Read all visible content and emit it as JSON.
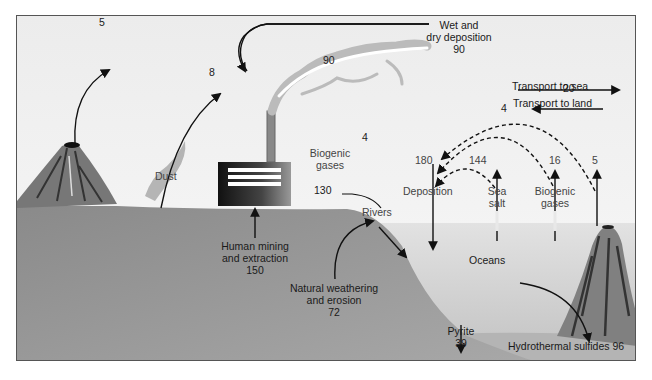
{
  "diagram": {
    "colors": {
      "sky": "#ececec",
      "land": "#8c8c8c",
      "ocean": "#c8c8c8",
      "arrow": "#111111",
      "frame": "#555555"
    },
    "atmosphere": {
      "volcanic_emission": "5",
      "dust": {
        "label": "Dust",
        "value": "8"
      },
      "industrial_cloud_value": "90",
      "wet_dry_deposition": {
        "line1": "Wet and",
        "line2": "dry deposition",
        "value": "90"
      },
      "land_biogenic_gases": {
        "label_line1": "Biogenic",
        "label_line2": "gases",
        "value": "4"
      },
      "transport_to_sea": {
        "label": "Transport to sea",
        "value": "20"
      },
      "transport_to_land": {
        "label": "Transport to land",
        "value": "4"
      }
    },
    "ocean_fluxes": {
      "deposition": {
        "label": "Deposition",
        "value": "180"
      },
      "sea_salt": {
        "label_line1": "Sea",
        "label_line2": "salt",
        "value": "144"
      },
      "biogenic_gases": {
        "label_line1": "Biogenic",
        "label_line2": "gases",
        "value": "16"
      },
      "submarine_volcano": {
        "value": "5"
      }
    },
    "land": {
      "human_mining": {
        "line1": "Human mining",
        "line2": "and extraction",
        "value": "150"
      },
      "rivers": {
        "label": "Rivers",
        "value": "130"
      },
      "natural_weathering": {
        "line1": "Natural weathering",
        "line2": "and erosion",
        "value": "72"
      }
    },
    "ocean": {
      "label": "Oceans",
      "pyrite": {
        "label": "Pyrite",
        "value": "39"
      },
      "hydrothermal": {
        "label": "Hydrothermal sulfides 96"
      }
    }
  }
}
